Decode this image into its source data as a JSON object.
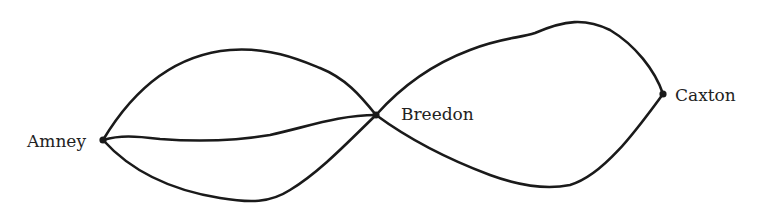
{
  "diagram": {
    "type": "network",
    "stroke_color": "#1a1a1a",
    "nodes": [
      {
        "id": "amney",
        "label": "Amney",
        "x": 103,
        "y": 140
      },
      {
        "id": "breedon",
        "label": "Breedon",
        "x": 376,
        "y": 115
      },
      {
        "id": "caxton",
        "label": "Caxton",
        "x": 663,
        "y": 94
      }
    ],
    "edges": [
      {
        "from": "amney",
        "to": "breedon",
        "route": "upper"
      },
      {
        "from": "amney",
        "to": "breedon",
        "route": "middle"
      },
      {
        "from": "amney",
        "to": "breedon",
        "route": "lower"
      },
      {
        "from": "breedon",
        "to": "caxton",
        "route": "upper"
      },
      {
        "from": "breedon",
        "to": "caxton",
        "route": "lower"
      }
    ]
  }
}
